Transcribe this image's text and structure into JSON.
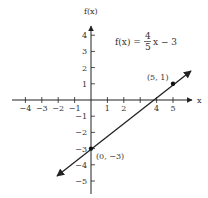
{
  "chart_data": {
    "type": "line",
    "title": "",
    "xlabel": "x",
    "ylabel": "f(x)",
    "equation": {
      "lhs": "f(x) =",
      "num": "4",
      "den": "5",
      "rhs": "x − 3"
    },
    "xlim": [
      -5,
      5.5
    ],
    "ylim": [
      -5.5,
      4.5
    ],
    "x_ticks": [
      -4,
      -3,
      -2,
      -1,
      1,
      2,
      4,
      5
    ],
    "x_tick_labels": [
      "−4",
      "−3",
      "−2",
      "−1",
      "1",
      "2",
      "4",
      "5"
    ],
    "y_ticks": [
      4,
      3,
      2,
      1,
      -1,
      -2,
      -3,
      -4,
      -5
    ],
    "y_tick_labels": [
      "4",
      "3",
      "2",
      "1",
      "−1",
      "−2",
      "−3",
      "−4",
      "−5"
    ],
    "series": [
      {
        "name": "f(x) = 4/5 x − 3",
        "x": [
          -2.1,
          0,
          5,
          6.2
        ],
        "y": [
          -4.7,
          -3,
          1,
          1.96
        ]
      }
    ],
    "points": [
      {
        "x": 5,
        "y": 1,
        "label": "(5, 1)"
      },
      {
        "x": 0,
        "y": -3,
        "label": "(0, −3)"
      }
    ],
    "grid": false,
    "legend": "none"
  }
}
